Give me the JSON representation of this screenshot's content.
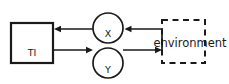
{
  "diagram": {
    "type": "block-diagram",
    "background_color": "#ffffff",
    "stroke_color": "#1a1a1a",
    "nodes": {
      "system_box": {
        "label": "TI",
        "shape": "rectangle",
        "border_style": "solid"
      },
      "signal_x": {
        "label": "X",
        "shape": "circle",
        "border_style": "solid"
      },
      "signal_y": {
        "label": "Y",
        "shape": "circle",
        "border_style": "solid"
      },
      "environment_box": {
        "label": "environment",
        "shape": "rectangle",
        "border_style": "dashed"
      }
    },
    "edges": [
      {
        "id": "env-to-x",
        "from": "environment_box",
        "to": "signal_x",
        "direction": "left",
        "arrowhead": true
      },
      {
        "id": "x-to-system",
        "from": "signal_x",
        "to": "system_box",
        "direction": "left",
        "arrowhead": true
      },
      {
        "id": "system-to-y",
        "from": "system_box",
        "to": "signal_y",
        "direction": "right",
        "arrowhead": true
      },
      {
        "id": "y-to-env",
        "from": "signal_y",
        "to": "environment_box",
        "direction": "right",
        "arrowhead": true
      }
    ]
  }
}
